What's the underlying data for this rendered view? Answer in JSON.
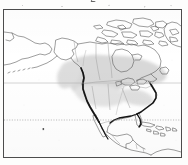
{
  "figure": {
    "kind": "distribution-range-map",
    "region": "North America",
    "clipped_caption_above": "g",
    "frame": {
      "x": 3,
      "y": 9,
      "width": 179,
      "height": 149,
      "border_color": "#4c4c4c"
    },
    "background_color": "#ffffff"
  },
  "legend_free": true,
  "map": {
    "projection_note": "equirectangular-like North America extent",
    "coastline_color": "#5a5a5a",
    "border_color": "#8c8c8c",
    "range_shading_color": "#c9c9c9",
    "highlight_coast_color": "#1a1a1a",
    "graticule_color": "#9a9a9a",
    "features": [
      {
        "name": "arctic-archipelago",
        "label": "Canadian Arctic Archipelago"
      },
      {
        "name": "greenland-edge",
        "label": "Greenland western margin"
      },
      {
        "name": "alaska",
        "label": "Alaska"
      },
      {
        "name": "aleutian-islands",
        "label": "Aleutian Islands"
      },
      {
        "name": "siberia-edge",
        "label": "Northeast Siberia"
      },
      {
        "name": "hudson-bay",
        "label": "Hudson Bay"
      },
      {
        "name": "great-lakes",
        "label": "Great Lakes"
      },
      {
        "name": "conterminous-us",
        "label": "Conterminous United States"
      },
      {
        "name": "mexico",
        "label": "Mexico"
      },
      {
        "name": "central-america",
        "label": "Central America"
      },
      {
        "name": "caribbean-islands",
        "label": "Caribbean Islands"
      },
      {
        "name": "south-america-edge",
        "label": "Northern South America"
      }
    ],
    "graticule_lines": [
      {
        "name": "upper-latitude-line",
        "style": "faint-solid",
        "y_px": 73
      },
      {
        "name": "tropic-latitude-line",
        "style": "dashed",
        "y_px": 110
      }
    ],
    "range_polygons": [
      {
        "name": "primary-range-shading",
        "description": "grey shaded breeding range across southern Canada and northern United States"
      }
    ],
    "highlight_segments": [
      {
        "name": "pacific-coast-highlight",
        "description": "thick dark line along the United States Pacific coast"
      },
      {
        "name": "atlantic-gulf-coast-highlight",
        "description": "thick dark line along the United States Atlantic and Gulf coasts"
      }
    ],
    "point_markers": [
      {
        "name": "ocean-point-marker-west",
        "x_px": 42,
        "y_px": 119
      },
      {
        "name": "ocean-point-marker-east",
        "x_px": 134,
        "y_px": 106
      }
    ]
  }
}
